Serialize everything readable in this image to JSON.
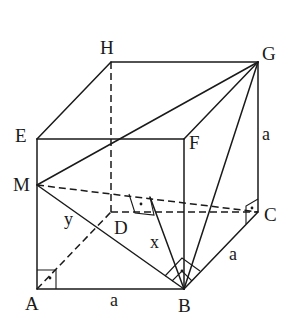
{
  "diagram": {
    "type": "cube-geometry",
    "vertices": {
      "A": {
        "label": "A",
        "x": 37,
        "y": 289
      },
      "B": {
        "label": "B",
        "x": 184,
        "y": 289
      },
      "C": {
        "label": "C",
        "x": 258,
        "y": 212
      },
      "D": {
        "label": "D",
        "x": 111,
        "y": 212
      },
      "E": {
        "label": "E",
        "x": 37,
        "y": 139
      },
      "F": {
        "label": "F",
        "x": 184,
        "y": 139
      },
      "G": {
        "label": "G",
        "x": 258,
        "y": 62
      },
      "H": {
        "label": "H",
        "x": 111,
        "y": 62
      },
      "M": {
        "label": "M",
        "x": 37,
        "y": 185
      }
    },
    "segment_labels": {
      "AB": "a",
      "BC": "a",
      "CG": "a",
      "MB": "y",
      "x_seg": "x"
    },
    "right_angle_marks": [
      "A",
      "B",
      "foot-on-MC",
      "C"
    ],
    "colors": {
      "stroke": "#1a1a1a",
      "background": "#ffffff"
    }
  }
}
